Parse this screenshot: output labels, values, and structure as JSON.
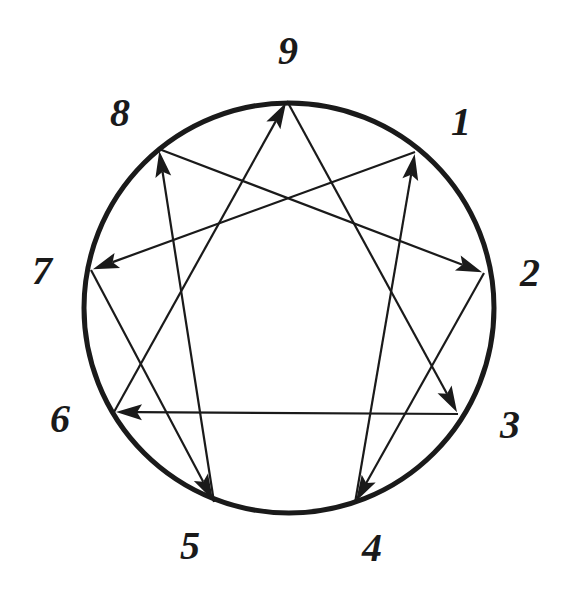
{
  "diagram": {
    "circle": {
      "cx": 289,
      "cy": 308,
      "r": 205,
      "color": "#1a1a1a"
    },
    "points": [
      {
        "id": "9",
        "label": "9",
        "x": 287,
        "y": 101,
        "label_x": 288,
        "label_y": 64
      },
      {
        "id": "1",
        "label": "1",
        "x": 415,
        "y": 152,
        "label_x": 461,
        "label_y": 135
      },
      {
        "id": "2",
        "label": "2",
        "x": 484,
        "y": 273,
        "label_x": 530,
        "label_y": 286
      },
      {
        "id": "3",
        "label": "3",
        "x": 458,
        "y": 414,
        "label_x": 510,
        "label_y": 438
      },
      {
        "id": "4",
        "label": "4",
        "x": 355,
        "y": 503,
        "label_x": 372,
        "label_y": 561
      },
      {
        "id": "5",
        "label": "5",
        "x": 214,
        "y": 502,
        "label_x": 190,
        "label_y": 559
      },
      {
        "id": "6",
        "label": "6",
        "x": 114,
        "y": 412,
        "label_x": 60,
        "label_y": 432
      },
      {
        "id": "7",
        "label": "7",
        "x": 91,
        "y": 270,
        "label_x": 42,
        "label_y": 284
      },
      {
        "id": "8",
        "label": "8",
        "x": 159,
        "y": 149,
        "label_x": 120,
        "label_y": 126
      }
    ],
    "arrows": [
      {
        "from": "6",
        "to": "9"
      },
      {
        "from": "9",
        "to": "3"
      },
      {
        "from": "3",
        "to": "6"
      },
      {
        "from": "1",
        "to": "7"
      },
      {
        "from": "7",
        "to": "5"
      },
      {
        "from": "5",
        "to": "8"
      },
      {
        "from": "8",
        "to": "2"
      },
      {
        "from": "2",
        "to": "4"
      },
      {
        "from": "4",
        "to": "1"
      }
    ]
  }
}
